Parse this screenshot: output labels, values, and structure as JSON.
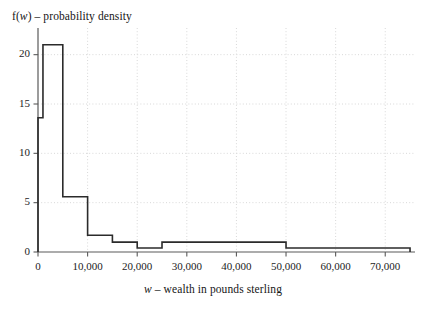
{
  "chart_data": {
    "type": "bar",
    "title": "",
    "ylabel": "f(w) – probability density",
    "ylabel_parts": {
      "f": "f(",
      "var": "w",
      "rest": ") – probability density"
    },
    "xlabel": "w – wealth in pounds sterling",
    "xlabel_parts": {
      "var": "w",
      "rest": " – wealth in pounds sterling"
    },
    "xlim": [
      0,
      76000
    ],
    "ylim": [
      0,
      22.5
    ],
    "grid": true,
    "grid_style": "dotted",
    "grid_color": "#d8d8d8",
    "legend": "none",
    "line_color": "#2b2b2b",
    "axis_color": "#5a5a5a",
    "xticks": [
      0,
      10000,
      20000,
      30000,
      40000,
      50000,
      60000,
      70000
    ],
    "xtick_labels": [
      "0",
      "10,000",
      "20,000",
      "30,000",
      "40,000",
      "50,000",
      "60,000",
      "70,000"
    ],
    "yticks": [
      0,
      5,
      10,
      15,
      20
    ],
    "ytick_labels": [
      "0",
      "5",
      "10",
      "15",
      "20"
    ],
    "bins": [
      {
        "x0": 0,
        "x1": 1000,
        "density": 13.6
      },
      {
        "x0": 1000,
        "x1": 5000,
        "density": 21.0
      },
      {
        "x0": 5000,
        "x1": 10000,
        "density": 5.6
      },
      {
        "x0": 10000,
        "x1": 15000,
        "density": 1.7
      },
      {
        "x0": 15000,
        "x1": 20000,
        "density": 1.0
      },
      {
        "x0": 20000,
        "x1": 25000,
        "density": 0.4
      },
      {
        "x0": 25000,
        "x1": 50000,
        "density": 1.0
      },
      {
        "x0": 50000,
        "x1": 75000,
        "density": 0.4
      }
    ]
  },
  "units": {
    "x": "pounds sterling",
    "y": "probability density"
  }
}
